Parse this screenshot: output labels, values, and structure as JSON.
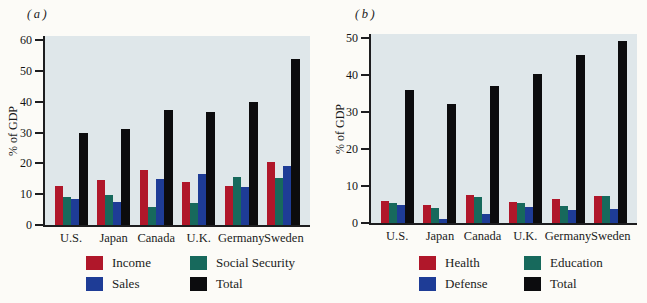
{
  "figure_bg": "#fcfbf7",
  "plot_bg": "#dfe7ea",
  "axis_color": "#1d1d1f",
  "chart_data": [
    {
      "type": "bar",
      "title": "(a)",
      "ylabel": "% of GDP",
      "categories": [
        "U.S.",
        "Japan",
        "Canada",
        "U.K.",
        "Germany",
        "Sweden"
      ],
      "series": [
        {
          "name": "Income",
          "color": "#b0172a",
          "values": [
            12.5,
            14.5,
            17.8,
            14.0,
            12.8,
            20.3
          ]
        },
        {
          "name": "Social Security",
          "color": "#17695c",
          "values": [
            9.0,
            9.7,
            6.0,
            7.0,
            15.7,
            15.3
          ]
        },
        {
          "name": "Sales",
          "color": "#1e3c96",
          "values": [
            8.5,
            7.6,
            14.8,
            16.4,
            12.3,
            19.2
          ]
        },
        {
          "name": "Total",
          "color": "#0c0c0e",
          "values": [
            30.0,
            31.0,
            37.3,
            36.5,
            40.0,
            53.8
          ]
        }
      ],
      "ylim": [
        0,
        60
      ],
      "ytick_step": 10,
      "grid": false,
      "legend_position": "bottom",
      "legend_columns": [
        [
          "Income",
          "Sales"
        ],
        [
          "Social Security",
          "Total"
        ]
      ]
    },
    {
      "type": "bar",
      "title": "(b)",
      "ylabel": "% of GDP",
      "categories": [
        "U.S.",
        "Japan",
        "Canada",
        "U.K.",
        "Germany",
        "Sweden"
      ],
      "series": [
        {
          "name": "Health",
          "color": "#b0172a",
          "values": [
            6.0,
            4.8,
            7.5,
            5.8,
            6.4,
            7.2
          ]
        },
        {
          "name": "Education",
          "color": "#17695c",
          "values": [
            5.5,
            4.0,
            7.0,
            5.4,
            4.6,
            7.2
          ]
        },
        {
          "name": "Defense",
          "color": "#1e3c96",
          "values": [
            5.0,
            1.2,
            2.4,
            4.3,
            3.5,
            3.7
          ]
        },
        {
          "name": "Total",
          "color": "#0c0c0e",
          "values": [
            36.0,
            32.3,
            37.0,
            40.4,
            45.5,
            49.3
          ]
        }
      ],
      "ylim": [
        0,
        50
      ],
      "ytick_step": 10,
      "grid": false,
      "legend_position": "bottom",
      "legend_columns": [
        [
          "Health",
          "Defense"
        ],
        [
          "Education",
          "Total"
        ]
      ]
    }
  ]
}
